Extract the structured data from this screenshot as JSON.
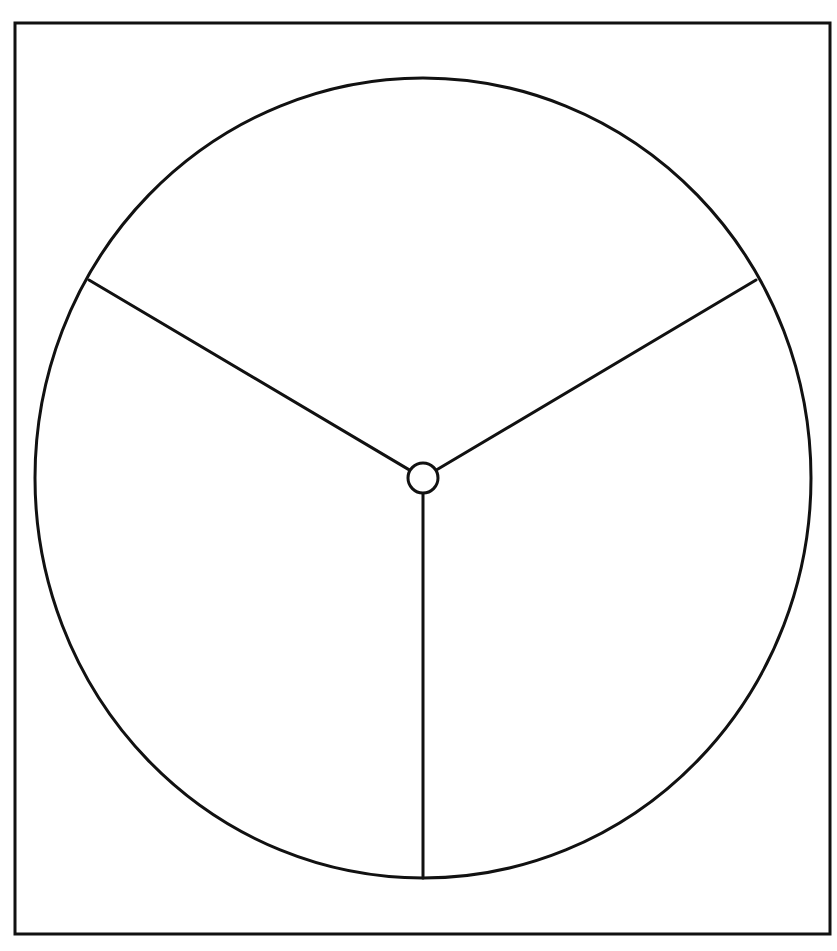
{
  "diagram": {
    "type": "blank-three-section-circle",
    "colors": {
      "background": "#ffffff",
      "stroke": "#111111"
    },
    "frame": {
      "x": 15,
      "y": 23,
      "width": 815,
      "height": 911,
      "stroke_width": 3
    },
    "circle": {
      "cx": 423,
      "cy": 478,
      "rx": 388,
      "ry": 400,
      "stroke_width": 3
    },
    "hub": {
      "cx": 423,
      "cy": 478,
      "r": 15,
      "stroke_width": 3
    },
    "sections": [
      {
        "id": "top",
        "label": ""
      },
      {
        "id": "bottom-left",
        "label": ""
      },
      {
        "id": "bottom-right",
        "label": ""
      }
    ],
    "spokes": [
      {
        "id": "spoke-upper-left",
        "x2": 89,
        "y2": 280
      },
      {
        "id": "spoke-upper-right",
        "x2": 756,
        "y2": 280
      },
      {
        "id": "spoke-bottom",
        "x2": 423,
        "y2": 878
      }
    ]
  },
  "chart_data": {
    "type": "pie",
    "title": "",
    "categories": [
      "",
      "",
      ""
    ],
    "values": [
      1,
      1,
      1
    ],
    "legend": "none",
    "note": "Blank three-equal-section circle template with center hub; no labels or text"
  }
}
